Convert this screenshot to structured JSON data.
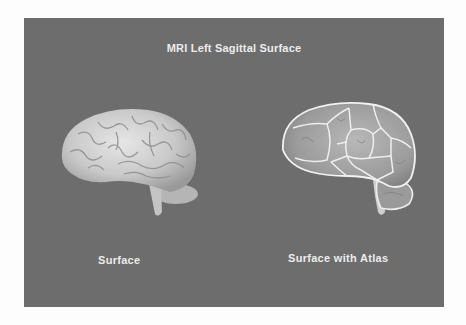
{
  "figure": {
    "title": "MRI Left Sagittal Surface",
    "panels": [
      {
        "label": "Surface",
        "image": "brain-surface-rendering"
      },
      {
        "label": "Surface with Atlas",
        "image": "brain-surface-with-atlas-outlines"
      }
    ]
  },
  "colors": {
    "page_background": "#fdfdfd",
    "panel_background": "#6d6d6d",
    "text": "#ececec"
  }
}
